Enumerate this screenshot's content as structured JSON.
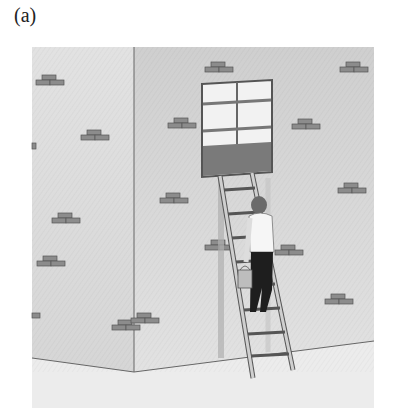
{
  "figure": {
    "label": "(a)",
    "colors": {
      "background": "#ffffff",
      "wall_left": "#e4e4e4",
      "wall_right": "#d9d9d9",
      "ground": "#ececec",
      "brick": "#8c8c8c",
      "brick_edge": "#555555",
      "window_frame": "#555555",
      "window_glass": "#f2f2f2",
      "window_lower_panel": "#7a7a7a",
      "ladder": "#c8c8c8",
      "ladder_edge": "#555555",
      "shirt": "#f6f6f6",
      "pants": "#1e1e1e",
      "hair": "#6a6a6a",
      "bucket": "#bdbdbd"
    }
  }
}
